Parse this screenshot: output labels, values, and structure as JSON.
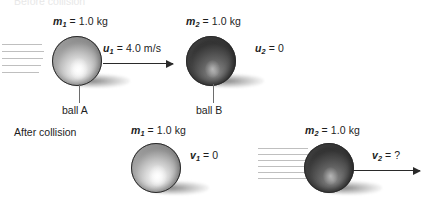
{
  "diagram": {
    "title_clipped": "Before collision",
    "section_label": "After collision",
    "before": {
      "ball_a": {
        "mass_label": "m",
        "mass_sub": "1",
        "mass_value": "= 1.0 kg",
        "velocity_label": "u",
        "velocity_sub": "1",
        "velocity_value": "= 4.0 m/s",
        "name": "ball A"
      },
      "ball_b": {
        "mass_label": "m",
        "mass_sub": "2",
        "mass_value": "= 1.0 kg",
        "velocity_label": "u",
        "velocity_sub": "2",
        "velocity_value": "= 0",
        "name": "ball B"
      }
    },
    "after": {
      "ball_a": {
        "mass_label": "m",
        "mass_sub": "1",
        "mass_value": "= 1.0 kg",
        "velocity_label": "v",
        "velocity_sub": "1",
        "velocity_value": "= 0"
      },
      "ball_b": {
        "mass_label": "m",
        "mass_sub": "2",
        "mass_value": "= 1.0 kg",
        "velocity_label": "v",
        "velocity_sub": "2",
        "velocity_value": "= ?"
      }
    },
    "colors": {
      "ink": "#1d1d1d",
      "arrow": "#2a2a2a",
      "speedline": "#bfbfbf",
      "leader": "#6d6d6d",
      "background": "#ffffff"
    }
  }
}
